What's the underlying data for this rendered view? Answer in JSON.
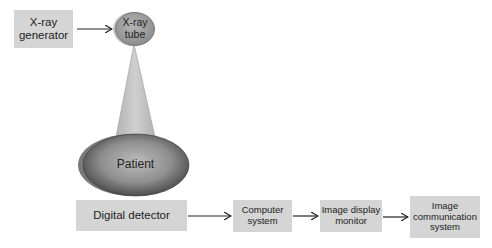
{
  "diagram": {
    "title": "",
    "nodes": {
      "xray_generator": {
        "label_line1": "X-ray",
        "label_line2": "generator"
      },
      "xray_tube": {
        "label_line1": "X-ray",
        "label_line2": "tube"
      },
      "patient": {
        "label": "Patient"
      },
      "digital_detector": {
        "label": "Digital detector"
      },
      "computer_system": {
        "label_line1": "Computer",
        "label_line2": "system"
      },
      "image_display_monitor": {
        "label_line1": "Image display",
        "label_line2": "monitor"
      },
      "image_communication_system": {
        "label_line1": "Image",
        "label_line2": "communication",
        "label_line3": "system"
      }
    },
    "edges": [
      {
        "from": "X-ray generator",
        "to": "X-ray tube"
      },
      {
        "from": "X-ray tube",
        "to": "Patient",
        "style": "x-ray beam cone"
      },
      {
        "from": "Digital detector",
        "to": "Computer system"
      },
      {
        "from": "Computer system",
        "to": "Image display monitor"
      },
      {
        "from": "Image display monitor",
        "to": "Image communication system"
      }
    ],
    "colors": {
      "box_fill": "#d5d5d5",
      "tube_fill": "#a8a8a8",
      "beam_fill": "#c4c4c4",
      "patient_center": "#b8b8b8",
      "patient_edge": "#4a4a4a",
      "arrow": "#222222"
    }
  }
}
